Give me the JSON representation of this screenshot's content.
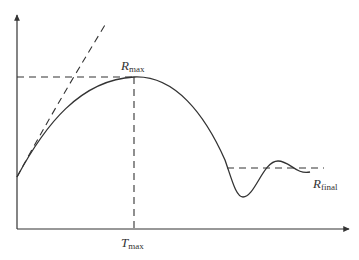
{
  "diagram": {
    "type": "response-curve",
    "colors": {
      "line": "#333333",
      "background": "#ffffff"
    },
    "axes": {
      "x_axis": {
        "has_arrow": true,
        "label": ""
      },
      "y_axis": {
        "has_arrow": true,
        "label": ""
      }
    },
    "labels": {
      "r_max": {
        "main": "R",
        "sub": "max"
      },
      "t_max": {
        "main": "T",
        "sub": "max"
      },
      "r_final": {
        "main": "R",
        "sub": "final"
      }
    },
    "curves": [
      {
        "name": "response-curve",
        "style": "solid",
        "description": "rises from start to peak R_max at T_max, falls, undershoots, oscillates and settles at R_final"
      },
      {
        "name": "initial-slope-curve",
        "style": "dashed",
        "description": "steeper dashed curve from start point rising out of the top of the plot"
      }
    ],
    "reference_lines": [
      {
        "name": "r-max-line",
        "style": "dashed",
        "orientation": "horizontal"
      },
      {
        "name": "t-max-line",
        "style": "dashed",
        "orientation": "vertical"
      },
      {
        "name": "r-final-line",
        "style": "dashed",
        "orientation": "horizontal"
      }
    ]
  }
}
